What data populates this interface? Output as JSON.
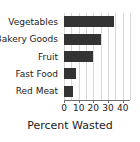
{
  "chart_data": {
    "type": "bar",
    "orientation": "horizontal",
    "title": "",
    "xlabel": "Percent Wasted",
    "ylabel": "",
    "categories": [
      "Vegetables",
      "Bakery Goods",
      "Fruit",
      "Fast Food",
      "Red Meat"
    ],
    "values": [
      34,
      25,
      20,
      8,
      6
    ],
    "xticks": [
      0,
      10,
      20,
      30,
      40
    ],
    "xtick_labels": [
      "0",
      "10",
      "20",
      "30",
      "40"
    ],
    "xlim": [
      0,
      45
    ],
    "grid": true,
    "grid_interval": 5,
    "legend": null,
    "bar_color": "#333333",
    "grid_color": "#d8d8d8",
    "axis_color": "#6f6f6f",
    "text_color": "#1a1a1a",
    "background": "#ffffff"
  }
}
